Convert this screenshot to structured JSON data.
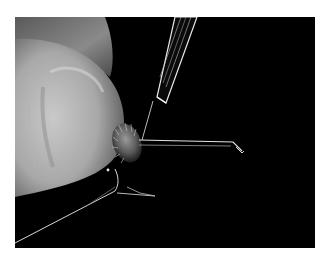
{
  "image": {
    "description": "Grayscale macro photograph: a fingertip holding an insect against a black background while a glass micropipette needle is inserted into it; a long thin leg extends to the right and two legs extend downward-left.",
    "background_color": "#000000",
    "border_color": "#ffffff",
    "subjects": [
      "fingertip",
      "insect",
      "glass-micropipette",
      "insect-legs"
    ]
  }
}
